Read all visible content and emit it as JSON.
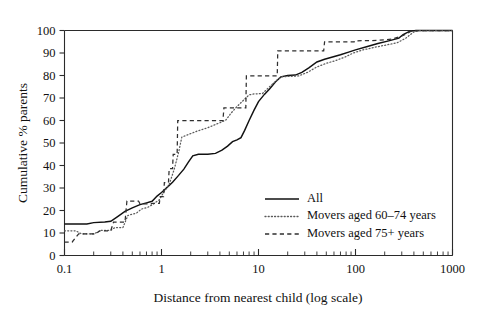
{
  "chart_data": {
    "type": "line",
    "title": "",
    "subtitle": "",
    "xlabel": "Distance from nearest child (log scale)",
    "ylabel": "Cumulative % parents",
    "xscale": "log",
    "xlim": [
      0.1,
      1000
    ],
    "ylim": [
      0,
      100
    ],
    "grid": false,
    "legend_position": "inside-bottom-right",
    "x_tick_labels": [
      "0.1",
      "1",
      "10",
      "100",
      "1000"
    ],
    "x_tick_values": [
      0.1,
      1,
      10,
      100,
      1000
    ],
    "y_tick_labels": [
      "0",
      "10",
      "20",
      "30",
      "40",
      "50",
      "60",
      "70",
      "80",
      "90",
      "100"
    ],
    "y_tick_values": [
      0,
      10,
      20,
      30,
      40,
      50,
      60,
      70,
      80,
      90,
      100
    ],
    "series": [
      {
        "name": "All",
        "style": "solid",
        "color": "#111111",
        "points": [
          [
            0.1,
            14.0
          ],
          [
            0.17,
            14.0
          ],
          [
            0.2,
            14.6
          ],
          [
            0.26,
            14.9
          ],
          [
            0.3,
            15.2
          ],
          [
            0.35,
            17.2
          ],
          [
            0.42,
            19.6
          ],
          [
            0.5,
            21.2
          ],
          [
            0.6,
            22.6
          ],
          [
            0.7,
            23.4
          ],
          [
            0.8,
            24.1
          ],
          [
            0.9,
            26.4
          ],
          [
            1.0,
            28.0
          ],
          [
            1.15,
            30.4
          ],
          [
            1.3,
            32.6
          ],
          [
            1.5,
            35.6
          ],
          [
            1.7,
            38.4
          ],
          [
            1.9,
            41.6
          ],
          [
            2.1,
            44.3
          ],
          [
            2.4,
            45.0
          ],
          [
            3.0,
            45.0
          ],
          [
            3.6,
            45.4
          ],
          [
            4.2,
            46.8
          ],
          [
            4.8,
            48.6
          ],
          [
            5.4,
            50.6
          ],
          [
            6.0,
            51.4
          ],
          [
            6.6,
            52.4
          ],
          [
            7.2,
            55.6
          ],
          [
            8.0,
            60.0
          ],
          [
            9.0,
            64.6
          ],
          [
            10.0,
            68.4
          ],
          [
            11.5,
            71.6
          ],
          [
            13.0,
            74.0
          ],
          [
            15.0,
            77.2
          ],
          [
            17.0,
            79.4
          ],
          [
            20.0,
            80.0
          ],
          [
            24.0,
            80.2
          ],
          [
            28.0,
            81.4
          ],
          [
            33.0,
            83.4
          ],
          [
            40.0,
            86.0
          ],
          [
            48.0,
            87.2
          ],
          [
            58.0,
            88.2
          ],
          [
            70.0,
            89.2
          ],
          [
            85.0,
            90.4
          ],
          [
            100.0,
            91.4
          ],
          [
            130.0,
            92.8
          ],
          [
            170.0,
            94.2
          ],
          [
            220.0,
            95.4
          ],
          [
            280.0,
            96.6
          ],
          [
            310.0,
            98.2
          ],
          [
            360.0,
            99.6
          ],
          [
            420.0,
            100.0
          ],
          [
            1000.0,
            100.0
          ]
        ]
      },
      {
        "name": "Movers aged 60-74 years",
        "style": "dotted",
        "color": "#5a5a5a",
        "points": [
          [
            0.1,
            11.0
          ],
          [
            0.13,
            11.0
          ],
          [
            0.15,
            9.6
          ],
          [
            0.2,
            9.6
          ],
          [
            0.24,
            11.2
          ],
          [
            0.3,
            11.2
          ],
          [
            0.33,
            12.4
          ],
          [
            0.4,
            12.4
          ],
          [
            0.45,
            17.8
          ],
          [
            0.55,
            18.8
          ],
          [
            0.62,
            20.6
          ],
          [
            0.72,
            21.4
          ],
          [
            0.82,
            22.8
          ],
          [
            0.95,
            24.8
          ],
          [
            1.05,
            28.0
          ],
          [
            1.2,
            31.6
          ],
          [
            1.35,
            38.2
          ],
          [
            1.5,
            45.8
          ],
          [
            1.62,
            52.6
          ],
          [
            1.85,
            53.6
          ],
          [
            2.3,
            55.2
          ],
          [
            3.0,
            56.8
          ],
          [
            3.6,
            58.2
          ],
          [
            4.2,
            59.4
          ],
          [
            4.6,
            60.2
          ],
          [
            5.2,
            63.2
          ],
          [
            6.0,
            66.2
          ],
          [
            7.0,
            69.0
          ],
          [
            8.0,
            71.4
          ],
          [
            9.0,
            71.8
          ],
          [
            11.0,
            72.0
          ],
          [
            13.0,
            75.0
          ],
          [
            15.0,
            77.4
          ],
          [
            17.0,
            79.4
          ],
          [
            20.0,
            79.6
          ],
          [
            26.0,
            79.8
          ],
          [
            32.0,
            81.4
          ],
          [
            40.0,
            83.8
          ],
          [
            50.0,
            85.4
          ],
          [
            62.0,
            86.6
          ],
          [
            78.0,
            88.2
          ],
          [
            95.0,
            90.0
          ],
          [
            120.0,
            91.4
          ],
          [
            160.0,
            92.6
          ],
          [
            210.0,
            93.6
          ],
          [
            270.0,
            94.6
          ],
          [
            330.0,
            96.6
          ],
          [
            400.0,
            99.4
          ],
          [
            460.0,
            100.0
          ],
          [
            1000.0,
            100.0
          ]
        ]
      },
      {
        "name": "Movers aged 75+ years",
        "style": "dashed",
        "color": "#2f2f2f",
        "points": [
          [
            0.1,
            6.0
          ],
          [
            0.12,
            6.0
          ],
          [
            0.14,
            9.6
          ],
          [
            0.21,
            9.6
          ],
          [
            0.23,
            11.0
          ],
          [
            0.3,
            11.0
          ],
          [
            0.32,
            14.8
          ],
          [
            0.42,
            14.8
          ],
          [
            0.44,
            24.2
          ],
          [
            0.58,
            24.2
          ],
          [
            0.6,
            23.0
          ],
          [
            0.78,
            23.0
          ],
          [
            0.8,
            23.2
          ],
          [
            0.95,
            23.2
          ],
          [
            0.97,
            26.2
          ],
          [
            1.05,
            26.2
          ],
          [
            1.07,
            32.4
          ],
          [
            1.18,
            32.4
          ],
          [
            1.2,
            38.6
          ],
          [
            1.3,
            38.6
          ],
          [
            1.32,
            45.0
          ],
          [
            1.45,
            45.0
          ],
          [
            1.47,
            60.0
          ],
          [
            4.3,
            60.0
          ],
          [
            4.4,
            65.6
          ],
          [
            7.4,
            65.6
          ],
          [
            7.5,
            79.8
          ],
          [
            15.6,
            79.8
          ],
          [
            15.8,
            91.0
          ],
          [
            47.0,
            91.0
          ],
          [
            48.0,
            95.0
          ],
          [
            97.0,
            95.0
          ],
          [
            98.0,
            95.4
          ],
          [
            170.0,
            95.6
          ],
          [
            240.0,
            96.2
          ],
          [
            310.0,
            97.8
          ],
          [
            370.0,
            99.6
          ],
          [
            430.0,
            100.0
          ],
          [
            1000.0,
            100.0
          ]
        ]
      }
    ]
  },
  "legend": {
    "items": [
      {
        "label": "All",
        "style": "solid"
      },
      {
        "label": "Movers aged 60–74 years",
        "style": "dotted"
      },
      {
        "label": "Movers aged 75+ years",
        "style": "dashed"
      }
    ]
  },
  "axes": {
    "x_title": "Distance from nearest child (log scale)",
    "y_title": "Cumulative % parents"
  }
}
